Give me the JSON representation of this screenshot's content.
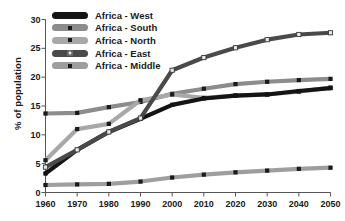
{
  "chart_data": {
    "type": "line",
    "title": "",
    "xlabel": "",
    "ylabel": "% of population",
    "x": [
      1960,
      1970,
      1980,
      1990,
      2000,
      2010,
      2020,
      2030,
      2040,
      2050
    ],
    "xtick_labels": [
      "1960",
      "1970",
      "1980",
      "1990",
      "2000",
      "2010",
      "2020",
      "2030",
      "2040",
      "2050"
    ],
    "ytick_labels": [
      "0",
      "5",
      "10",
      "15",
      "20",
      "25",
      "30"
    ],
    "yticks": [
      0,
      5,
      10,
      15,
      20,
      25,
      30
    ],
    "ylim": [
      0,
      30
    ],
    "xlim": [
      1960,
      2050
    ],
    "grid": false,
    "legend_position": "top-left",
    "series": [
      {
        "name": "Africa - West",
        "color": "#141414",
        "marker": "square",
        "marker_color": "#141414",
        "values": [
          3.3,
          7.4,
          10.5,
          12.8,
          15.2,
          16.3,
          16.8,
          17.0,
          17.6,
          18.1
        ]
      },
      {
        "name": "Africa - South",
        "color": "#8c8c8c",
        "marker": "square",
        "marker_color": "#1a1a1a",
        "values": [
          13.7,
          13.8,
          14.8,
          15.7,
          17.1,
          18.0,
          18.8,
          19.2,
          19.5,
          19.7
        ]
      },
      {
        "name": "Africa - North",
        "color": "#a8a8a8",
        "marker": "square",
        "marker_color": "#1a1a1a",
        "values": [
          5.6,
          11.0,
          11.9,
          16.0,
          17.0,
          16.4,
          16.8,
          17.0,
          17.5,
          18.2
        ]
      },
      {
        "name": "Africa - East",
        "color": "#4a4a4a",
        "marker": "square-open",
        "marker_color": "#3a3a3a",
        "values": [
          4.4,
          7.4,
          10.5,
          12.9,
          21.2,
          23.4,
          25.1,
          26.5,
          27.4,
          27.7
        ]
      },
      {
        "name": "Africa - Middle",
        "color": "#9e9e9e",
        "marker": "square",
        "marker_color": "#1a1a1a",
        "values": [
          1.3,
          1.4,
          1.5,
          1.9,
          2.6,
          3.1,
          3.5,
          3.8,
          4.1,
          4.3
        ]
      }
    ]
  },
  "legend": {
    "items": [
      {
        "label": "Africa - West"
      },
      {
        "label": "Africa - South"
      },
      {
        "label": "Africa - North"
      },
      {
        "label": "Africa - East"
      },
      {
        "label": "Africa - Middle"
      }
    ]
  },
  "axes": {
    "ylabel": "% of population"
  }
}
